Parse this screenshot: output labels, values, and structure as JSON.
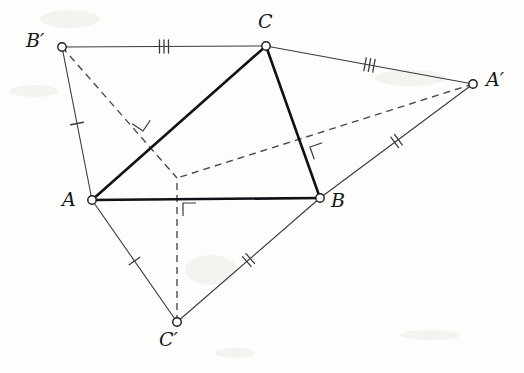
{
  "figure": {
    "background_color": "#fdfdfc",
    "ink_color": "#1b1b20",
    "bold_stroke_color": "#111116",
    "thin_stroke_color": "#3a3a42",
    "dashed_stroke_color": "#4a4a52",
    "vertices": [
      {
        "id": "A",
        "label": "A",
        "x": 92,
        "y": 200,
        "label_x": 62,
        "label_y": 190,
        "radius": 4.2
      },
      {
        "id": "B",
        "label": "B",
        "x": 320,
        "y": 198,
        "label_x": 331,
        "label_y": 191,
        "radius": 4.2
      },
      {
        "id": "C",
        "label": "C",
        "x": 266,
        "y": 46,
        "label_x": 258,
        "label_y": 12,
        "radius": 4.2
      },
      {
        "id": "Ap",
        "label": "A′",
        "x": 473,
        "y": 84,
        "label_x": 486,
        "label_y": 70,
        "radius": 4.2
      },
      {
        "id": "Bp",
        "label": "B′",
        "x": 62,
        "y": 47,
        "label_x": 26,
        "label_y": 31,
        "radius": 4.2
      },
      {
        "id": "Cp",
        "label": "C′",
        "x": 177,
        "y": 322,
        "label_x": 159,
        "label_y": 330,
        "radius": 4.2
      }
    ],
    "interior_point": {
      "id": "P",
      "x": 177,
      "y": 178
    },
    "bold_edges": [
      {
        "name": "edge-AB",
        "from": "A",
        "to": "B",
        "width": 2.6
      },
      {
        "name": "edge-BC",
        "from": "B",
        "to": "C",
        "width": 2.6
      },
      {
        "name": "edge-CA",
        "from": "C",
        "to": "A",
        "width": 2.6
      }
    ],
    "thin_edges": [
      {
        "name": "edge-Bp-C",
        "from": "Bp",
        "to": "C",
        "width": 1.1
      },
      {
        "name": "edge-C-Ap",
        "from": "C",
        "to": "Ap",
        "width": 1.1
      },
      {
        "name": "edge-Ap-B",
        "from": "Ap",
        "to": "B",
        "width": 1.1
      },
      {
        "name": "edge-B-Cp",
        "from": "B",
        "to": "Cp",
        "width": 1.1
      },
      {
        "name": "edge-Cp-A",
        "from": "Cp",
        "to": "A",
        "width": 1.1
      },
      {
        "name": "edge-A-Bp",
        "from": "A",
        "to": "Bp",
        "width": 1.1
      }
    ],
    "dashed_edges": [
      {
        "name": "cevian-Bp-P",
        "from": "Bp",
        "to": "P",
        "width": 1.4,
        "dash": "7,5"
      },
      {
        "name": "cevian-Ap-P",
        "from": "Ap",
        "to": "P",
        "width": 1.4,
        "dash": "7,5"
      },
      {
        "name": "cevian-Cp-P",
        "from": "Cp",
        "to": "P",
        "width": 1.4,
        "dash": "7,5"
      }
    ],
    "tick_marks": [
      {
        "name": "tick-Bp-C",
        "edge": "edge-Bp-C",
        "count": 3,
        "t": 0.5,
        "length": 13,
        "spacing": 4.5
      },
      {
        "name": "tick-C-Ap",
        "edge": "edge-C-Ap",
        "count": 3,
        "t": 0.5,
        "length": 13,
        "spacing": 4.5
      },
      {
        "name": "tick-Ap-B",
        "edge": "edge-Ap-B",
        "count": 2,
        "t": 0.5,
        "length": 13,
        "spacing": 4.5
      },
      {
        "name": "tick-B-Cp",
        "edge": "edge-B-Cp",
        "count": 2,
        "t": 0.5,
        "length": 13,
        "spacing": 4.5
      },
      {
        "name": "tick-Cp-A",
        "edge": "edge-Cp-A",
        "count": 1,
        "t": 0.5,
        "length": 13,
        "spacing": 4.5
      },
      {
        "name": "tick-A-Bp",
        "edge": "edge-A-Bp",
        "count": 1,
        "t": 0.5,
        "length": 13,
        "spacing": 4.5
      }
    ],
    "right_angle_marks": [
      {
        "name": "right-angle-on-CA",
        "x": 143,
        "y": 131,
        "size": 13,
        "rotation": -146,
        "note": "perpendicular of cevian B'P with side CA"
      },
      {
        "name": "right-angle-on-BC",
        "x": 310,
        "y": 147,
        "size": 13,
        "rotation": -19,
        "note": "perpendicular of cevian A'P with side BC"
      },
      {
        "name": "right-angle-on-AB",
        "x": 183,
        "y": 203,
        "size": 13,
        "rotation": 0,
        "note": "perpendicular of cevian C'P with side AB"
      }
    ],
    "paper_marks": [
      {
        "x": 40,
        "y": 10,
        "w": 60,
        "h": 18
      },
      {
        "x": 10,
        "y": 85,
        "w": 48,
        "h": 12
      },
      {
        "x": 375,
        "y": 70,
        "w": 70,
        "h": 16
      },
      {
        "x": 185,
        "y": 255,
        "w": 52,
        "h": 30
      },
      {
        "x": 400,
        "y": 330,
        "w": 60,
        "h": 10
      },
      {
        "x": 215,
        "y": 348,
        "w": 40,
        "h": 10
      }
    ]
  }
}
